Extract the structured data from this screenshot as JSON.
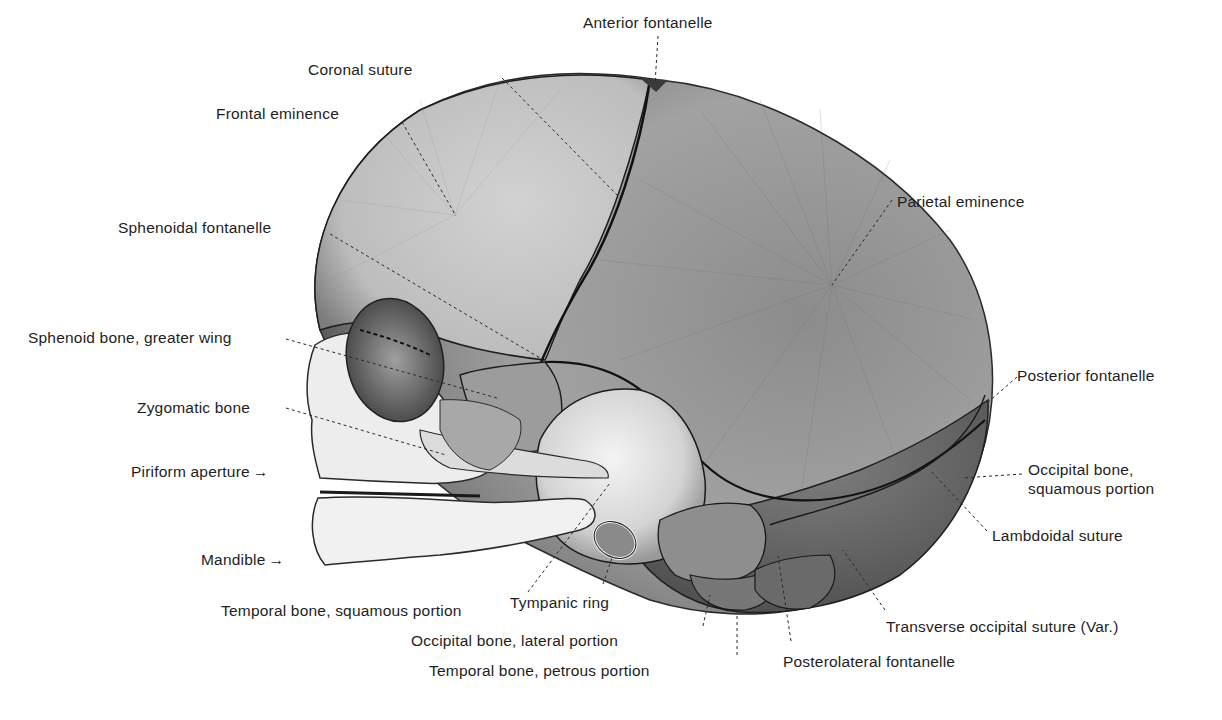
{
  "figure": {
    "colors": {
      "background": "#ffffff",
      "parietal": "#9a9a9a",
      "parietal_dark": "#555555",
      "frontal": "#c8c8c8",
      "occipital": "#6e6e6e",
      "face_bone": "#ececec",
      "temporal_squama": "#dcdcdc",
      "suture_line": "#1a1a1a",
      "label_text": "#1e1e1e",
      "leader_line": "#333333"
    },
    "labels": {
      "anterior_fontanelle": "Anterior fontanelle",
      "coronal_suture": "Coronal suture",
      "frontal_eminence": "Frontal eminence",
      "parietal_eminence": "Parietal eminence",
      "sphenoidal_fontanelle": "Sphenoidal fontanelle",
      "sphenoid_greater_wing": "Sphenoid bone, greater wing",
      "posterior_fontanelle": "Posterior fontanelle",
      "zygomatic_bone": "Zygomatic bone",
      "piriform_aperture": "Piriform aperture",
      "occipital_squamous_1": "Occipital bone,",
      "occipital_squamous_2": "squamous portion",
      "lambdoidal_suture": "Lambdoidal suture",
      "mandible": "Mandible",
      "temporal_squamous": "Temporal bone, squamous portion",
      "tympanic_ring": "Tympanic ring",
      "transverse_occipital_suture": "Transverse occipital suture (Var.)",
      "occipital_lateral": "Occipital bone, lateral portion",
      "temporal_petrous": "Temporal bone, petrous portion",
      "posterolateral_fontanelle": "Posterolateral fontanelle"
    },
    "arrow_glyph": "→"
  }
}
